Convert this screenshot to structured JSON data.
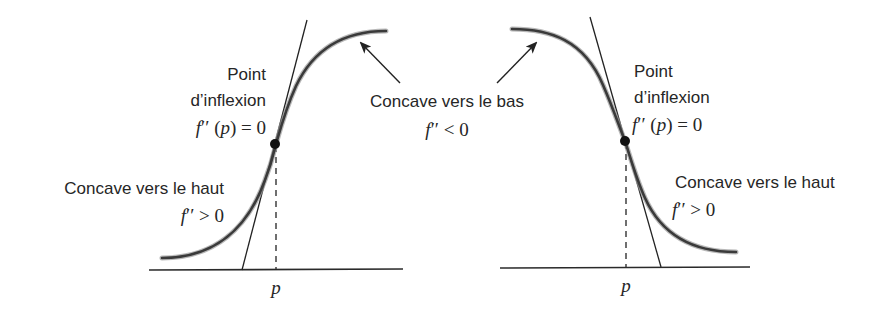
{
  "figure": {
    "left_panel": {
      "type": "increasing sigmoid with inflection point",
      "inflection_label": {
        "line1": "Point",
        "line2": "d’inflexion",
        "math_f": "f",
        "math_rest": "′′ (",
        "math_p": "p",
        "math_end": ") = 0"
      },
      "concave_up_label": {
        "text": "Concave vers le haut",
        "math_f": "f",
        "math_rest": "′′ > 0"
      },
      "axis_label_p": "p"
    },
    "shared_label": {
      "text": "Concave vers le bas",
      "math_f": "f",
      "math_rest": "′′ < 0"
    },
    "right_panel": {
      "type": "decreasing sigmoid with inflection point",
      "inflection_label": {
        "line1": "Point",
        "line2": "d’inflexion",
        "math_f": "f",
        "math_rest": "′′ (",
        "math_p": "p",
        "math_end": ") = 0"
      },
      "concave_up_label": {
        "text": "Concave vers le haut",
        "math_f": "f",
        "math_rest": "′′ > 0"
      },
      "axis_label_p": "p"
    },
    "colors": {
      "curve": "#3a3a3a",
      "curve_halo": "#9a9a9a",
      "lines": "#222222",
      "text": "#262626",
      "background": "#ffffff"
    }
  }
}
